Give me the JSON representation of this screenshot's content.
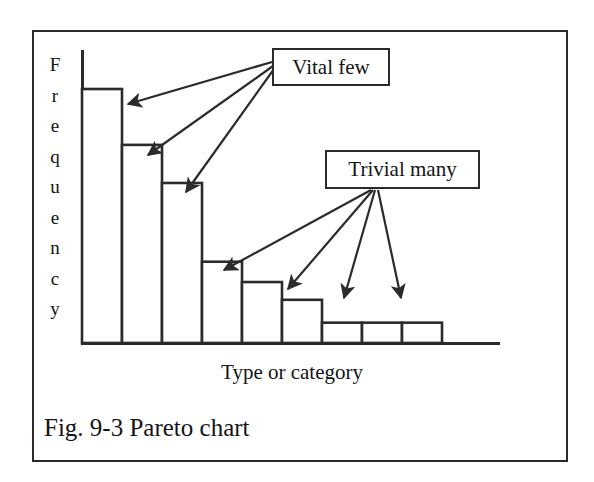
{
  "figure": {
    "caption": "Fig. 9-3 Pareto chart",
    "frame_color": "#2b2b2b",
    "background_color": "#ffffff"
  },
  "annotations": [
    {
      "id": "vital-few",
      "label": "Vital few",
      "points_to_bars": [
        1,
        2,
        3
      ]
    },
    {
      "id": "trivial-many",
      "label": "Trivial many",
      "points_to_bars": [
        4,
        5,
        7,
        8
      ]
    }
  ],
  "chart_data": {
    "type": "bar",
    "title": "Fig. 9-3 Pareto chart",
    "xlabel": "Type or category",
    "ylabel": "Frequency",
    "ylabel_letters": [
      "F",
      "r",
      "e",
      "q",
      "u",
      "e",
      "n",
      "c",
      "y"
    ],
    "categories": [
      "1",
      "2",
      "3",
      "4",
      "5",
      "6",
      "7",
      "8",
      "9"
    ],
    "values": [
      100,
      78,
      63,
      32,
      24,
      17,
      8,
      8,
      8
    ],
    "ylim": [
      0,
      115
    ],
    "grid": false,
    "legend": null,
    "bar_fill": "#ffffff",
    "bar_stroke": "#2b2b2b",
    "annotation_labels": [
      "Vital few",
      "Trivial many"
    ]
  }
}
